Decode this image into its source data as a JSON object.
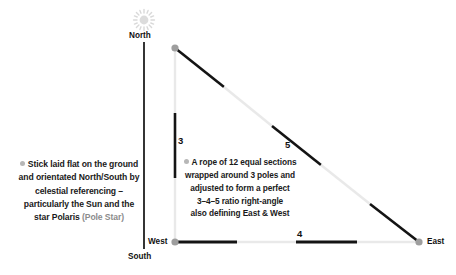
{
  "diagram": {
    "compass": {
      "north_label": "North",
      "south_label": "South",
      "west_label": "West",
      "east_label": "East"
    },
    "icons": {
      "sun": "sun-icon",
      "bullet": "bullet-dot-icon",
      "pole": "pole-marker-icon"
    },
    "side_labels": {
      "vertical": "3",
      "hypotenuse": "5",
      "horizontal": "4"
    },
    "left_note": {
      "lines": [
        "Stick laid flat on the ground",
        "and orientated North/South by",
        "celestial referencing –",
        "particularly the Sun and the"
      ],
      "last_line_bold": "star Polaris",
      "last_line_soft": "(Pole Star)"
    },
    "center_note": {
      "lines": [
        "A rope of 12 equal sections",
        "wrapped around 3 poles and",
        "adjusted to form a perfect",
        "3–4–5 ratio right-angle",
        "also defining East & West"
      ]
    },
    "colors": {
      "rope_dark": "#141414",
      "rope_light": "#e9e9e9",
      "pole_marker": "#9e9e9e",
      "stick": "#1f1f1f",
      "sun": "#d6d6d6",
      "text": "#1a1a1a",
      "soft_text": "#8c8c8c"
    },
    "geometry": {
      "apex": [
        175,
        48
      ],
      "corner": [
        175,
        242
      ],
      "east": [
        419,
        242
      ],
      "stick_x": 144,
      "stick_top": 42,
      "stick_bottom": 249
    }
  }
}
